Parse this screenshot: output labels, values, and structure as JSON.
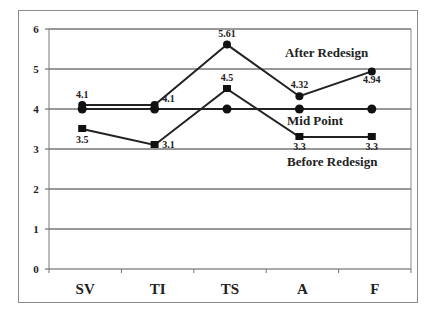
{
  "chart_data": {
    "type": "line",
    "title": "",
    "xlabel": "",
    "ylabel": "",
    "categories": [
      "SV",
      "TI",
      "TS",
      "A",
      "F"
    ],
    "ylim": [
      0,
      6
    ],
    "yticks": [
      0,
      1,
      2,
      3,
      4,
      5,
      6
    ],
    "grid": true,
    "legend_position": "inline labels",
    "series": [
      {
        "name": "After Redesign",
        "values": [
          4.1,
          4.1,
          5.61,
          4.32,
          4.94
        ],
        "labels": [
          "4.1",
          "4.1",
          "5.61",
          "4.32",
          "4.94"
        ],
        "marker": "circle"
      },
      {
        "name": "Mid Point",
        "values": [
          4,
          4,
          4,
          4,
          4
        ],
        "labels": [],
        "marker": "circle"
      },
      {
        "name": "Before Redesign",
        "values": [
          3.5,
          3.1,
          4.5,
          3.3,
          3.3
        ],
        "labels": [
          "3.5",
          "3.1",
          "4.5",
          "3.3",
          "3.3"
        ],
        "marker": "square"
      }
    ],
    "annotations": [
      "After Redesign",
      "Mid Point",
      "Before Redesign"
    ]
  },
  "colors": {
    "line": "#222222",
    "grid": "#333333",
    "frame": "#8a8a8a"
  }
}
